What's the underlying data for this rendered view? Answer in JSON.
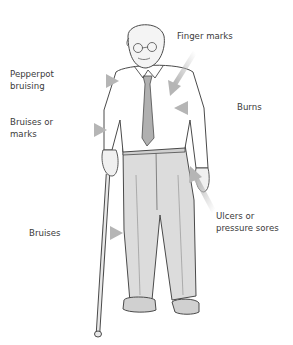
{
  "diagram": {
    "labels": [
      {
        "id": "finger-marks",
        "text": "Finger marks"
      },
      {
        "id": "pepperpot-bruising",
        "text": "Pepperpot\nbruising"
      },
      {
        "id": "burns",
        "text": "Burns"
      },
      {
        "id": "bruises-or-marks",
        "text": "Bruises or\nmarks"
      },
      {
        "id": "ulcers",
        "text": "Ulcers or\npressure sores"
      },
      {
        "id": "bruises",
        "text": "Bruises"
      }
    ],
    "colors": {
      "background": "#ffffff",
      "text": "#3a3a3a",
      "arrow": "#bdbdbd",
      "line": "#4a4a4a",
      "trousers": "#d9d9d9",
      "tie": "#a9a9a9"
    }
  }
}
